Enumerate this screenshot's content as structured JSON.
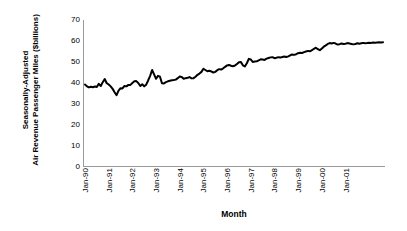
{
  "chart_data": {
    "type": "line",
    "title": "",
    "xlabel": "Month",
    "ylabel_line1": "Seasonally-Adjusted",
    "ylabel_line2": "Air Revenue Passenger Miles ($billions)",
    "ylim": [
      0,
      70
    ],
    "yticks": [
      0,
      10,
      20,
      30,
      40,
      50,
      60,
      70
    ],
    "ytick_labels": [
      "0",
      "10",
      "20",
      "30",
      "40",
      "50",
      "60",
      "70"
    ],
    "xtick_labels": [
      "Jan-90",
      "Jan-91",
      "Jan-92",
      "Jan-93",
      "Jan-94",
      "Jan-95",
      "Jan-96",
      "Jan-97",
      "Jan-98",
      "Jan-99",
      "Jan-00",
      "Jan-01"
    ],
    "xtick_index": [
      0,
      12,
      24,
      36,
      48,
      60,
      72,
      84,
      96,
      108,
      120,
      132
    ],
    "xtick_rotation": 90,
    "grid": false,
    "legend": false,
    "line_color": "#000000",
    "line_width": 2,
    "axis_color": "#808080",
    "x_start_label": "Jan-90",
    "x_end_label": "Jun-02",
    "n_points": 150,
    "series": [
      {
        "name": "Seasonally-Adjusted Air Revenue Passenger Miles",
        "units": "$billions",
        "values": [
          39.3,
          38.4,
          37.9,
          38.2,
          38.0,
          38.3,
          38.1,
          39.6,
          38.6,
          40.4,
          41.9,
          39.9,
          39.3,
          38.4,
          37.2,
          35.6,
          34.2,
          36.4,
          37.5,
          37.4,
          38.6,
          38.4,
          39.1,
          39.1,
          40.0,
          40.8,
          40.9,
          40.0,
          38.6,
          39.4,
          38.4,
          39.2,
          41.2,
          43.4,
          46.2,
          44.1,
          42.0,
          43.4,
          43.0,
          39.9,
          39.8,
          40.4,
          40.8,
          41.1,
          41.3,
          41.4,
          41.6,
          42.3,
          43.1,
          42.9,
          42.0,
          42.3,
          42.5,
          42.8,
          42.2,
          42.3,
          43.0,
          43.9,
          44.5,
          45.3,
          46.8,
          46.2,
          45.6,
          45.8,
          45.5,
          45.0,
          45.3,
          46.1,
          46.6,
          46.4,
          47.0,
          47.7,
          48.4,
          48.6,
          48.2,
          48.0,
          48.3,
          49.1,
          49.9,
          50.0,
          48.4,
          47.9,
          49.4,
          51.5,
          51.2,
          50.0,
          50.2,
          50.3,
          50.8,
          51.3,
          51.2,
          51.0,
          51.6,
          51.9,
          52.2,
          52.3,
          51.8,
          52.0,
          52.3,
          52.1,
          52.4,
          52.6,
          52.4,
          52.7,
          53.2,
          53.6,
          53.4,
          53.7,
          54.2,
          54.4,
          54.3,
          54.7,
          55.0,
          55.3,
          55.1,
          55.6,
          56.3,
          56.8,
          56.1,
          55.6,
          56.4,
          57.3,
          57.9,
          58.6,
          59.0,
          58.8,
          59.1,
          58.8,
          58.3,
          58.5,
          58.8,
          58.6,
          58.7,
          59.0,
          58.8,
          58.6,
          58.4,
          58.6,
          58.9,
          58.7,
          58.9,
          59.1,
          58.9,
          59.0,
          59.2,
          59.1,
          59.3,
          59.2,
          59.3,
          59.4,
          59.3,
          59.4
        ]
      }
    ]
  }
}
